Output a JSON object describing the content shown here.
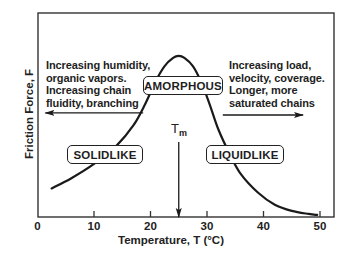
{
  "chart_data": {
    "type": "line",
    "title": "",
    "xlabel": "Temperature, T (°C)",
    "ylabel": "Friction Force, F",
    "xlim": [
      0,
      52.5
    ],
    "ylim": [
      0,
      1
    ],
    "grid": false,
    "x_ticks": [
      0,
      10,
      20,
      30,
      40,
      50
    ],
    "x_tick_labels": [
      "0",
      "10",
      "20",
      "30",
      "40",
      "50"
    ],
    "y_ticks": [],
    "series": [
      {
        "name": "Friction force",
        "color": "#1a1a1a",
        "x": [
          2.5,
          6,
          10,
          14,
          17,
          19,
          21,
          22.5,
          24,
          25,
          26,
          27.5,
          29,
          30.5,
          32,
          34,
          36,
          39,
          42,
          45,
          48,
          49.5
        ],
        "y": [
          0.14,
          0.19,
          0.26,
          0.35,
          0.45,
          0.55,
          0.67,
          0.74,
          0.78,
          0.79,
          0.78,
          0.74,
          0.66,
          0.55,
          0.43,
          0.31,
          0.21,
          0.12,
          0.06,
          0.03,
          0.015,
          0.01
        ]
      }
    ],
    "annotations": {
      "tm_label": "T",
      "tm_sub": "m",
      "tm_value": 25,
      "left_text": [
        "Increasing humidity,",
        "organic vapors.",
        "Increasing chain",
        "fluidity, branching"
      ],
      "right_text": [
        "Increasing load,",
        "velocity, coverage.",
        "Longer, more",
        "saturated chains"
      ],
      "regions": {
        "amorphous": "AMORPHOUS",
        "solidlike": "SOLIDLIKE",
        "liquidlike": "LIQUIDLIKE"
      },
      "left_arrow": {
        "from_T": 18.7,
        "to_T": 1.4,
        "level": 0.51
      },
      "right_arrow": {
        "from_T": 32.8,
        "to_T": 47,
        "level": 0.5
      }
    }
  }
}
